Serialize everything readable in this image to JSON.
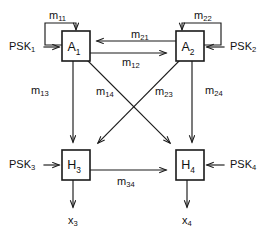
{
  "diagram": {
    "stroke_color": "#1a1a1a",
    "background_color": "#ffffff",
    "blocks": [
      {
        "id": "A1",
        "base": "A",
        "sub": "1",
        "x": 62,
        "y": 31,
        "w": 28,
        "h": 30
      },
      {
        "id": "A2",
        "base": "A",
        "sub": "2",
        "x": 176,
        "y": 31,
        "w": 28,
        "h": 30
      },
      {
        "id": "H3",
        "base": "H",
        "sub": "3",
        "x": 62,
        "y": 150,
        "w": 28,
        "h": 30
      },
      {
        "id": "H4",
        "base": "H",
        "sub": "4",
        "x": 176,
        "y": 150,
        "w": 28,
        "h": 30
      }
    ],
    "inputs": [
      {
        "id": "PSK1",
        "base": "PSK",
        "sub": "1",
        "x": 10,
        "y": 47
      },
      {
        "id": "PSK2",
        "base": "PSK",
        "sub": "2",
        "x": 228,
        "y": 47
      },
      {
        "id": "PSK3",
        "base": "PSK",
        "sub": "3",
        "x": 10,
        "y": 165
      },
      {
        "id": "PSK4",
        "base": "PSK",
        "sub": "4",
        "x": 228,
        "y": 165
      }
    ],
    "outputs": [
      {
        "id": "x3",
        "base": "x",
        "sub": "3",
        "x": 76,
        "y": 221
      },
      {
        "id": "x4",
        "base": "x",
        "sub": "4",
        "x": 190,
        "y": 221
      }
    ],
    "edges": [
      {
        "id": "m11",
        "base": "m",
        "sub": "11",
        "from": "A1",
        "to": "A1",
        "kind": "self-loop",
        "lx": 50,
        "ly": 16
      },
      {
        "id": "m22",
        "base": "m",
        "sub": "22",
        "from": "A2",
        "to": "A2",
        "kind": "self-loop",
        "lx": 196,
        "ly": 16
      },
      {
        "id": "m21",
        "base": "m",
        "sub": "21",
        "from": "A2",
        "to": "A1",
        "kind": "horizontal-left",
        "lx": 133,
        "ly": 36
      },
      {
        "id": "m12",
        "base": "m",
        "sub": "12",
        "from": "A1",
        "to": "A2",
        "kind": "horizontal-right",
        "lx": 125,
        "ly": 62
      },
      {
        "id": "m13",
        "base": "m",
        "sub": "13",
        "from": "A1",
        "to": "H3",
        "kind": "vertical",
        "lx": 33,
        "ly": 92
      },
      {
        "id": "m14",
        "base": "m",
        "sub": "14",
        "from": "A1",
        "to": "H4",
        "kind": "diagonal",
        "lx": 99,
        "ly": 93
      },
      {
        "id": "m23",
        "base": "m",
        "sub": "23",
        "from": "A2",
        "to": "H3",
        "kind": "diagonal",
        "lx": 158,
        "ly": 93
      },
      {
        "id": "m24",
        "base": "m",
        "sub": "24",
        "from": "A2",
        "to": "H4",
        "kind": "vertical",
        "lx": 207,
        "ly": 92
      },
      {
        "id": "m34",
        "base": "m",
        "sub": "34",
        "from": "H3",
        "to": "H4",
        "kind": "horizontal-right",
        "lx": 120,
        "ly": 182
      }
    ]
  }
}
